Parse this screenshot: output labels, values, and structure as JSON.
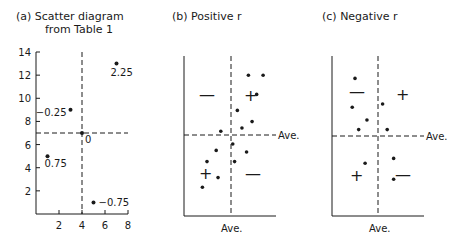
{
  "chart_data": [
    {
      "type": "scatter",
      "title_line1": "(a) Scatter diagram",
      "title_line2": "from Table 1",
      "xlim": [
        0,
        8
      ],
      "ylim": [
        0,
        14
      ],
      "xticks": [
        2,
        4,
        6,
        8
      ],
      "yticks": [
        2,
        4,
        6,
        8,
        10,
        12,
        14
      ],
      "x_mean": 4,
      "y_mean": 7,
      "points": [
        {
          "x": 1,
          "y": 5,
          "label": "0.75"
        },
        {
          "x": 3,
          "y": 9,
          "label": "−0.25"
        },
        {
          "x": 4,
          "y": 7,
          "label": "0"
        },
        {
          "x": 5,
          "y": 1,
          "label": "−0.75"
        },
        {
          "x": 7,
          "y": 13,
          "label": "2.25"
        }
      ]
    },
    {
      "type": "scatter",
      "title": "(b)  Positive r",
      "xlabel": "Ave.",
      "hline_label": "Ave.",
      "quadrant_signs": {
        "top_left": "—",
        "top_right": "+",
        "bottom_left": "+",
        "bottom_right": "—"
      },
      "points": [
        {
          "x": 0.7,
          "y": 0.88
        },
        {
          "x": 0.86,
          "y": 0.88
        },
        {
          "x": 0.79,
          "y": 0.76
        },
        {
          "x": 0.58,
          "y": 0.66
        },
        {
          "x": 0.63,
          "y": 0.55
        },
        {
          "x": 0.74,
          "y": 0.59
        },
        {
          "x": 0.4,
          "y": 0.53
        },
        {
          "x": 0.53,
          "y": 0.45
        },
        {
          "x": 0.68,
          "y": 0.4
        },
        {
          "x": 0.35,
          "y": 0.41
        },
        {
          "x": 0.25,
          "y": 0.34
        },
        {
          "x": 0.55,
          "y": 0.34
        },
        {
          "x": 0.37,
          "y": 0.24
        },
        {
          "x": 0.2,
          "y": 0.18
        }
      ]
    },
    {
      "type": "scatter",
      "title": "(c) Negative r",
      "xlabel": "Ave.",
      "hline_label": "Ave.",
      "quadrant_signs": {
        "top_left": "—",
        "top_right": "+",
        "bottom_left": "+",
        "bottom_right": "—"
      },
      "points": [
        {
          "x": 0.25,
          "y": 0.86
        },
        {
          "x": 0.22,
          "y": 0.68
        },
        {
          "x": 0.38,
          "y": 0.6
        },
        {
          "x": 0.29,
          "y": 0.54
        },
        {
          "x": 0.55,
          "y": 0.7
        },
        {
          "x": 0.6,
          "y": 0.54
        },
        {
          "x": 0.36,
          "y": 0.33
        },
        {
          "x": 0.67,
          "y": 0.36
        },
        {
          "x": 0.67,
          "y": 0.23
        }
      ]
    }
  ]
}
